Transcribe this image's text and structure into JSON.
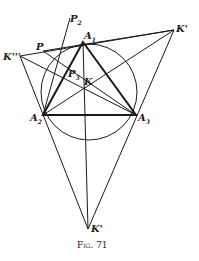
{
  "figure": {
    "caption": "Fig. 71",
    "points": {
      "A1": {
        "label": "A",
        "sub": "1",
        "x": 83,
        "y": 42
      },
      "A2": {
        "label": "A",
        "sub": "2",
        "x": 43,
        "y": 115
      },
      "A3": {
        "label": "A",
        "sub": "3",
        "x": 136,
        "y": 115
      },
      "K": {
        "label": "K",
        "x": 85,
        "y": 88
      },
      "K1": {
        "label": "K'",
        "x": 174,
        "y": 30
      },
      "K2": {
        "label": "K'",
        "x": 88,
        "y": 229
      },
      "K3": {
        "label": "K'''",
        "x": 20,
        "y": 56
      },
      "P": {
        "label": "P",
        "x": 43,
        "y": 51
      },
      "P2": {
        "label": "P",
        "sub": "2",
        "x": 70,
        "y": 24
      },
      "P3": {
        "label": "P",
        "sub": "3",
        "x": 72,
        "y": 74
      }
    },
    "circle": {
      "cx": 89,
      "cy": 92,
      "r": 48
    },
    "stroke_color": "#1a1a1a"
  }
}
